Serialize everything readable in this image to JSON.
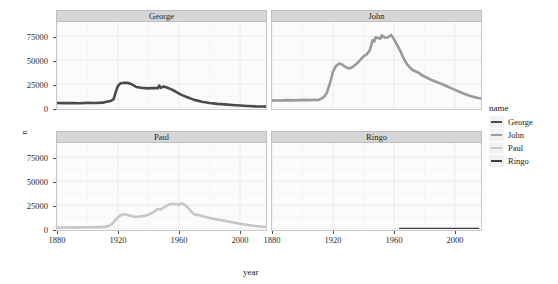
{
  "chart_data": {
    "type": "line",
    "title": "",
    "xlabel": "year",
    "ylabel": "n",
    "xlim": [
      1880,
      2017
    ],
    "ylim": [
      0,
      90000
    ],
    "xticks": [
      1880,
      1920,
      1960,
      2000
    ],
    "xtick_labels": [
      "1880",
      "1920",
      "1960",
      "2000"
    ],
    "yticks": [
      0,
      25000,
      50000,
      75000
    ],
    "ytick_labels": [
      "0",
      "25000",
      "50000",
      "75000"
    ],
    "grid": true,
    "legend_position": "right",
    "legend_title": "name",
    "facet_variable": "name",
    "facets": [
      {
        "label": "George",
        "color": "#4a4a4a",
        "x": [
          1880,
          1885,
          1890,
          1895,
          1900,
          1905,
          1910,
          1913,
          1915,
          1917,
          1918,
          1919,
          1920,
          1921,
          1922,
          1924,
          1926,
          1928,
          1930,
          1932,
          1934,
          1936,
          1938,
          1940,
          1942,
          1944,
          1946,
          1947,
          1948,
          1950,
          1952,
          1955,
          1958,
          1960,
          1962,
          1965,
          1970,
          1975,
          1980,
          1985,
          1990,
          1995,
          2000,
          2005,
          2010,
          2015,
          2017
        ],
        "y": [
          5200,
          5100,
          5300,
          5000,
          5400,
          5200,
          5600,
          6800,
          7200,
          9000,
          14000,
          19000,
          23000,
          25000,
          26000,
          26500,
          26300,
          25500,
          24000,
          22000,
          21500,
          21000,
          20800,
          20500,
          20800,
          21000,
          20600,
          23500,
          21000,
          22500,
          21500,
          19500,
          17000,
          15000,
          13500,
          11500,
          8500,
          6500,
          5200,
          4300,
          3800,
          3200,
          2600,
          2100,
          1700,
          1500,
          1450
        ]
      },
      {
        "label": "John",
        "color": "#9a9a9a",
        "x": [
          1880,
          1885,
          1890,
          1895,
          1900,
          1905,
          1908,
          1910,
          1912,
          1914,
          1916,
          1918,
          1920,
          1922,
          1924,
          1926,
          1928,
          1930,
          1932,
          1934,
          1936,
          1938,
          1940,
          1942,
          1944,
          1946,
          1947,
          1948,
          1950,
          1951,
          1952,
          1954,
          1956,
          1958,
          1960,
          1962,
          1964,
          1966,
          1968,
          1970,
          1972,
          1974,
          1976,
          1978,
          1980,
          1985,
          1990,
          1995,
          2000,
          2005,
          2010,
          2015,
          2017
        ],
        "y": [
          8000,
          7800,
          8200,
          8000,
          8500,
          8200,
          8600,
          8300,
          9500,
          11500,
          16000,
          26000,
          38000,
          44000,
          46500,
          45500,
          43000,
          41500,
          42000,
          44500,
          47000,
          50500,
          54000,
          56000,
          60000,
          71000,
          69500,
          74000,
          73000,
          72500,
          76000,
          73500,
          74000,
          76500,
          72000,
          66000,
          60000,
          53000,
          47000,
          43000,
          40000,
          38500,
          37000,
          34500,
          33000,
          29000,
          26000,
          22500,
          19000,
          15500,
          12500,
          10500,
          10000
        ]
      },
      {
        "label": "Paul",
        "color": "#c6c6c6",
        "x": [
          1880,
          1885,
          1890,
          1895,
          1900,
          1905,
          1908,
          1910,
          1912,
          1914,
          1916,
          1918,
          1920,
          1922,
          1924,
          1926,
          1928,
          1930,
          1932,
          1934,
          1936,
          1938,
          1940,
          1942,
          1944,
          1946,
          1948,
          1950,
          1952,
          1954,
          1956,
          1958,
          1960,
          1962,
          1964,
          1966,
          1968,
          1970,
          1972,
          1975,
          1980,
          1985,
          1990,
          1995,
          2000,
          2005,
          2010,
          2015,
          2017
        ],
        "y": [
          1600,
          1500,
          1700,
          1600,
          1800,
          1900,
          2000,
          2100,
          2500,
          3200,
          5000,
          8500,
          12500,
          14500,
          15500,
          15000,
          13800,
          13000,
          12800,
          13000,
          13500,
          14000,
          15000,
          16500,
          18500,
          21000,
          20500,
          22500,
          24500,
          26000,
          26500,
          26000,
          25500,
          26800,
          25000,
          22000,
          18000,
          15500,
          14800,
          13500,
          11500,
          10000,
          8500,
          7000,
          5500,
          4200,
          3200,
          2400,
          2200
        ]
      },
      {
        "label": "Ringo",
        "color": "#3d3d3d",
        "x": [
          1964,
          1970,
          1980,
          1990,
          2000,
          2010,
          2015
        ],
        "y": [
          30,
          30,
          30,
          30,
          30,
          30,
          30
        ]
      }
    ],
    "legend_entries": [
      {
        "label": "George",
        "color": "#4a4a4a"
      },
      {
        "label": "John",
        "color": "#9a9a9a"
      },
      {
        "label": "Paul",
        "color": "#c6c6c6"
      },
      {
        "label": "Ringo",
        "color": "#3d3d3d"
      }
    ]
  }
}
